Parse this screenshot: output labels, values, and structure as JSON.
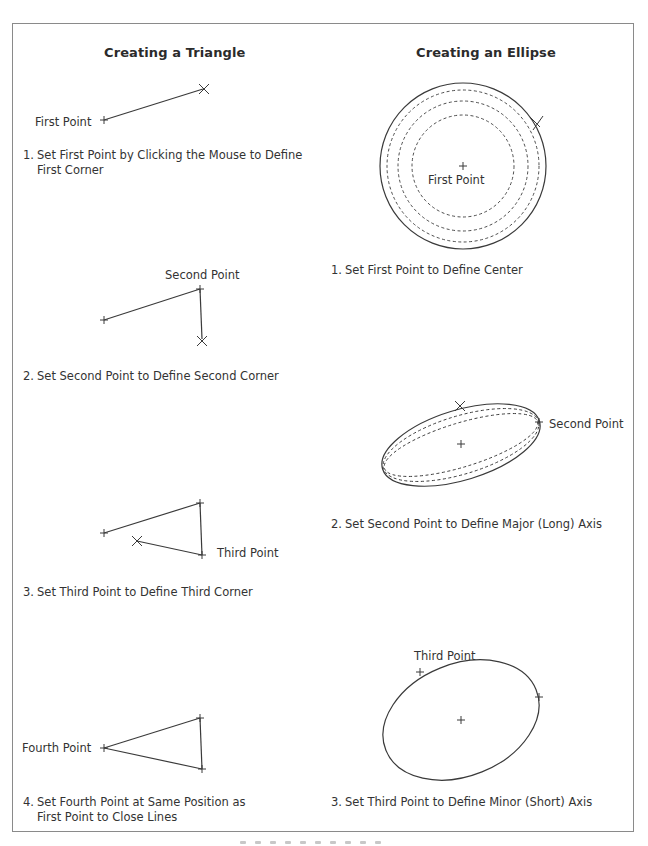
{
  "left_column": {
    "title": "Creating a Triangle",
    "steps": [
      {
        "number": "1.",
        "text_line1": "Set First Point by Clicking the Mouse to Define",
        "text_line2": "First Corner",
        "point_labels": [
          "First Point"
        ]
      },
      {
        "number": "2.",
        "text_line1": "Set Second Point to Define Second Corner",
        "point_labels": [
          "Second Point"
        ]
      },
      {
        "number": "3.",
        "text_line1": "Set Third Point to Define Third Corner",
        "point_labels": [
          "Third Point"
        ]
      },
      {
        "number": "4.",
        "text_line1": "Set Fourth Point at Same Position as",
        "text_line2": "First Point to Close Lines",
        "point_labels": [
          "Fourth Point"
        ]
      }
    ]
  },
  "right_column": {
    "title": "Creating an Ellipse",
    "steps": [
      {
        "number": "1.",
        "text_line1": "Set First Point to Define Center",
        "point_labels": [
          "First Point"
        ]
      },
      {
        "number": "2.",
        "text_line1": "Set Second Point to Define Major (Long) Axis",
        "point_labels": [
          "Second Point"
        ]
      },
      {
        "number": "3.",
        "text_line1": "Set Third Point to Define Minor (Short) Axis",
        "point_labels": [
          "Third Point"
        ]
      }
    ]
  },
  "icons": {
    "point_marker": "plus-cross",
    "cursor_marker": "x-cursor"
  },
  "colors": {
    "line": "#3a3a3a",
    "frame": "#8a8a8a",
    "text": "#333333",
    "background": "#ffffff"
  }
}
